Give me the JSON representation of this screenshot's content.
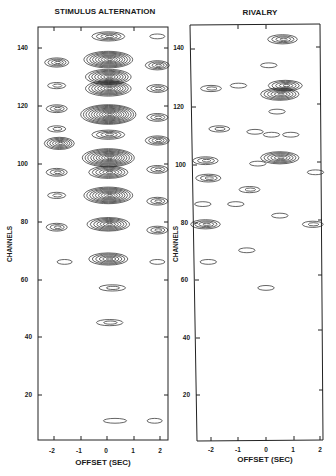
{
  "chart_data": [
    {
      "type": "heatmap",
      "subtype": "contour",
      "title": "STIMULUS ALTERNATION",
      "xlabel": "OFFSET (SEC)",
      "ylabel": "CHANNELS",
      "xlim": [
        -2.5,
        2.2
      ],
      "ylim": [
        4,
        147
      ],
      "x_ticks": [
        -2,
        -1,
        0,
        1,
        2
      ],
      "x_tick_labels": [
        "-2",
        "-1",
        "0",
        "1",
        "2"
      ],
      "y_ticks": [
        20,
        40,
        60,
        80,
        100,
        120,
        140
      ],
      "y_tick_labels": [
        "20",
        "40",
        "60",
        "80",
        "100",
        "120",
        "140"
      ],
      "grid": false,
      "peaks": [
        {
          "x": 0.05,
          "y": 144,
          "levels": 4
        },
        {
          "x": 0.05,
          "y": 136,
          "levels": 9
        },
        {
          "x": 0.05,
          "y": 130,
          "levels": 8
        },
        {
          "x": 0.05,
          "y": 126,
          "levels": 8
        },
        {
          "x": 0.05,
          "y": 117,
          "levels": 11
        },
        {
          "x": 0.05,
          "y": 110,
          "levels": 4
        },
        {
          "x": 0.05,
          "y": 102,
          "levels": 10
        },
        {
          "x": 0.05,
          "y": 97,
          "levels": 6
        },
        {
          "x": 0.05,
          "y": 89,
          "levels": 9
        },
        {
          "x": 0.05,
          "y": 79,
          "levels": 7
        },
        {
          "x": 0.05,
          "y": 67,
          "levels": 6
        },
        {
          "x": 0.2,
          "y": 57,
          "levels": 2
        },
        {
          "x": 0.1,
          "y": 45,
          "levels": 2
        },
        {
          "x": 0.3,
          "y": 11,
          "levels": 1
        },
        {
          "x": -1.9,
          "y": 135,
          "levels": 4
        },
        {
          "x": -1.9,
          "y": 127,
          "levels": 2
        },
        {
          "x": -1.9,
          "y": 119,
          "levels": 3
        },
        {
          "x": -1.9,
          "y": 112,
          "levels": 2
        },
        {
          "x": -1.8,
          "y": 107,
          "levels": 6
        },
        {
          "x": -1.9,
          "y": 97,
          "levels": 3
        },
        {
          "x": -1.9,
          "y": 89,
          "levels": 2
        },
        {
          "x": -1.9,
          "y": 78,
          "levels": 3
        },
        {
          "x": -1.6,
          "y": 66,
          "levels": 1
        },
        {
          "x": 1.9,
          "y": 144,
          "levels": 1
        },
        {
          "x": 1.9,
          "y": 134,
          "levels": 4
        },
        {
          "x": 1.9,
          "y": 126,
          "levels": 3
        },
        {
          "x": 1.9,
          "y": 116,
          "levels": 3
        },
        {
          "x": 1.9,
          "y": 108,
          "levels": 4
        },
        {
          "x": 1.9,
          "y": 98,
          "levels": 3
        },
        {
          "x": 1.9,
          "y": 87,
          "levels": 3
        },
        {
          "x": 1.9,
          "y": 77,
          "levels": 3
        },
        {
          "x": 1.9,
          "y": 66,
          "levels": 1
        },
        {
          "x": 1.8,
          "y": 11,
          "levels": 1
        }
      ]
    },
    {
      "type": "heatmap",
      "subtype": "contour",
      "title": "RIVALRY",
      "xlabel": "OFFSET (SEC)",
      "ylabel": "CHANNELS",
      "xlim": [
        -2.7,
        2.0
      ],
      "ylim": [
        4,
        147
      ],
      "x_ticks": [
        -2,
        -1,
        0,
        1,
        2
      ],
      "x_tick_labels": [
        "-2",
        "-1",
        "0",
        "1",
        "2"
      ],
      "y_ticks": [
        20,
        40,
        60,
        80,
        100,
        120,
        140
      ],
      "y_tick_labels": [
        "20",
        "40",
        "60",
        "80",
        "100",
        "120",
        "140"
      ],
      "grid": false,
      "peaks": [
        {
          "x": 0.6,
          "y": 143,
          "levels": 4
        },
        {
          "x": 0.1,
          "y": 134,
          "levels": 1
        },
        {
          "x": 0.7,
          "y": 127,
          "levels": 5
        },
        {
          "x": 0.5,
          "y": 124,
          "levels": 6
        },
        {
          "x": -2.0,
          "y": 126,
          "levels": 2
        },
        {
          "x": -1.0,
          "y": 127,
          "levels": 1
        },
        {
          "x": 0.4,
          "y": 118,
          "levels": 1
        },
        {
          "x": -1.7,
          "y": 112,
          "levels": 2
        },
        {
          "x": -0.4,
          "y": 111,
          "levels": 1
        },
        {
          "x": 0.2,
          "y": 110,
          "levels": 1
        },
        {
          "x": 0.9,
          "y": 110,
          "levels": 1
        },
        {
          "x": 0.5,
          "y": 102,
          "levels": 6
        },
        {
          "x": -0.3,
          "y": 100,
          "levels": 1
        },
        {
          "x": -2.2,
          "y": 101,
          "levels": 3
        },
        {
          "x": -2.1,
          "y": 95,
          "levels": 3
        },
        {
          "x": -0.6,
          "y": 91,
          "levels": 2
        },
        {
          "x": 1.8,
          "y": 97,
          "levels": 1
        },
        {
          "x": -2.3,
          "y": 86,
          "levels": 1
        },
        {
          "x": -1.1,
          "y": 86,
          "levels": 1
        },
        {
          "x": 0.5,
          "y": 82,
          "levels": 1
        },
        {
          "x": -2.2,
          "y": 79,
          "levels": 4
        },
        {
          "x": 1.7,
          "y": 79,
          "levels": 2
        },
        {
          "x": -0.7,
          "y": 70,
          "levels": 1
        },
        {
          "x": -2.1,
          "y": 66,
          "levels": 1
        },
        {
          "x": 0.0,
          "y": 57,
          "levels": 1
        }
      ]
    }
  ]
}
